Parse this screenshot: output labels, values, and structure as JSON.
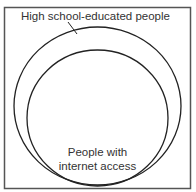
{
  "diagram": {
    "type": "venn",
    "sets": [
      {
        "label": "High school-educated people",
        "role": "outer"
      },
      {
        "label_line1": "People with",
        "label_line2": "internet access",
        "role": "inner"
      }
    ],
    "colors": {
      "stroke": "#222222",
      "text": "#333333",
      "background": "#ffffff"
    }
  }
}
